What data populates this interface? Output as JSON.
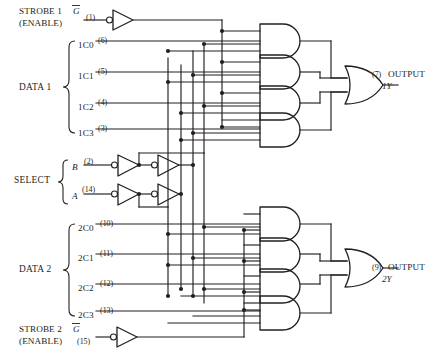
{
  "diagram": {
    "type": "logic-schematic",
    "strobe1": {
      "line1": "STROBE 1",
      "overbar_signal": "G",
      "line2": "(ENABLE)",
      "pin": "(1)"
    },
    "strobe2": {
      "line1": "STROBE 2",
      "overbar_signal": "G",
      "line2": "(ENABLE)",
      "pin": "(15)"
    },
    "data1": {
      "group_label": "DATA 1",
      "inputs": [
        {
          "name": "1C0",
          "pin": "(6)"
        },
        {
          "name": "1C1",
          "pin": "(5)"
        },
        {
          "name": "1C2",
          "pin": "(4)"
        },
        {
          "name": "1C3",
          "pin": "(3)"
        }
      ]
    },
    "data2": {
      "group_label": "DATA 2",
      "inputs": [
        {
          "name": "2C0",
          "pin": "(10)"
        },
        {
          "name": "2C1",
          "pin": "(11)"
        },
        {
          "name": "2C2",
          "pin": "(12)"
        },
        {
          "name": "2C3",
          "pin": "(13)"
        }
      ]
    },
    "select": {
      "group_label": "SELECT",
      "inputs": [
        {
          "name": "B",
          "pin": "(2)"
        },
        {
          "name": "A",
          "pin": "(14)"
        }
      ]
    },
    "outputs": [
      {
        "pin": "(7)",
        "label": "OUTPUT",
        "signal": "1Y"
      },
      {
        "pin": "(9)",
        "label": "OUTPUT",
        "signal": "2Y"
      }
    ],
    "gates": {
      "and_count": 8,
      "or_count": 2,
      "inverter_count": 6,
      "and_inputs": 4,
      "or_inputs": 4
    },
    "colors": {
      "ink": "#231f20",
      "background": "#ffffff"
    }
  }
}
